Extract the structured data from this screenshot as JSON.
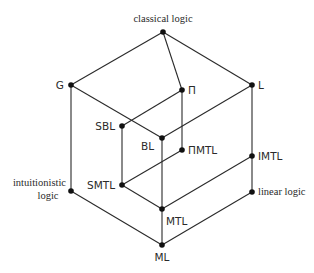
{
  "diagram": {
    "type": "lattice",
    "nodes": [
      {
        "id": "classical",
        "label": "classical logic",
        "x": 163,
        "y": 32,
        "lx": 163,
        "ly": 22,
        "anchor": "middle",
        "font": "serif"
      },
      {
        "id": "G",
        "label": "G",
        "x": 71,
        "y": 85,
        "lx": 64,
        "ly": 89,
        "anchor": "end",
        "font": "sans"
      },
      {
        "id": "Pi",
        "label": "Π",
        "x": 182,
        "y": 90,
        "lx": 188,
        "ly": 94,
        "anchor": "start",
        "font": "sans"
      },
      {
        "id": "L",
        "label": "L",
        "x": 252,
        "y": 85,
        "lx": 258,
        "ly": 89,
        "anchor": "start",
        "font": "sans"
      },
      {
        "id": "SBL",
        "label": "SBL",
        "x": 122,
        "y": 126,
        "lx": 115,
        "ly": 130,
        "anchor": "end",
        "font": "sans"
      },
      {
        "id": "BL",
        "label": "BL",
        "x": 162,
        "y": 138,
        "lx": 154,
        "ly": 150,
        "anchor": "end",
        "font": "sans"
      },
      {
        "id": "PiMTL",
        "label": "ΠMTL",
        "x": 182,
        "y": 150,
        "lx": 188,
        "ly": 154,
        "anchor": "start",
        "font": "sans"
      },
      {
        "id": "IMTL",
        "label": "IMTL",
        "x": 252,
        "y": 156,
        "lx": 258,
        "ly": 160,
        "anchor": "start",
        "font": "sans"
      },
      {
        "id": "SMTL",
        "label": "SMTL",
        "x": 122,
        "y": 185,
        "lx": 115,
        "ly": 189,
        "anchor": "end",
        "font": "sans"
      },
      {
        "id": "intuitionistic",
        "label": "intuitionistic",
        "label2": "logic",
        "x": 71,
        "y": 191,
        "lx": 66,
        "ly": 186,
        "anchor": "end",
        "font": "serif"
      },
      {
        "id": "linear",
        "label": "linear logic",
        "x": 252,
        "y": 192,
        "lx": 258,
        "ly": 195,
        "anchor": "start",
        "font": "serif"
      },
      {
        "id": "MTL",
        "label": "MTL",
        "x": 162,
        "y": 209,
        "lx": 166,
        "ly": 225,
        "anchor": "start",
        "font": "sans"
      },
      {
        "id": "ML",
        "label": "ML",
        "x": 162,
        "y": 245,
        "lx": 162,
        "ly": 261,
        "anchor": "middle",
        "font": "sans"
      }
    ],
    "edges": [
      [
        "classical",
        "G"
      ],
      [
        "classical",
        "L"
      ],
      [
        "classical",
        "Pi"
      ],
      [
        "G",
        "intuitionistic"
      ],
      [
        "G",
        "BL"
      ],
      [
        "L",
        "BL"
      ],
      [
        "L",
        "IMTL"
      ],
      [
        "Pi",
        "SBL"
      ],
      [
        "Pi",
        "PiMTL"
      ],
      [
        "SBL",
        "SMTL"
      ],
      [
        "BL",
        "MTL"
      ],
      [
        "PiMTL",
        "SMTL"
      ],
      [
        "SMTL",
        "MTL"
      ],
      [
        "IMTL",
        "MTL"
      ],
      [
        "IMTL",
        "linear"
      ],
      [
        "intuitionistic",
        "ML"
      ],
      [
        "linear",
        "ML"
      ],
      [
        "MTL",
        "ML"
      ]
    ]
  }
}
